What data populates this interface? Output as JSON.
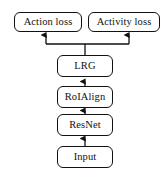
{
  "diagram": {
    "type": "flowchart",
    "direction": "bottom-to-top",
    "style": {
      "background": "#ffffff",
      "stroke": "#111111",
      "text_color": "#111111",
      "box_fill": "#ffffff"
    },
    "nodes": [
      {
        "id": "action_loss",
        "label": "Action loss",
        "row": "loss",
        "column": "left"
      },
      {
        "id": "activity_loss",
        "label": "Activity loss",
        "row": "loss",
        "column": "right"
      },
      {
        "id": "lrg",
        "label": "LRG",
        "row": "stage",
        "column": "center"
      },
      {
        "id": "roialign",
        "label": "RoIAlign",
        "row": "stage",
        "column": "center"
      },
      {
        "id": "resnet",
        "label": "ResNet",
        "row": "stage",
        "column": "center"
      },
      {
        "id": "input",
        "label": "Input",
        "row": "stage",
        "column": "center"
      }
    ],
    "edges": [
      {
        "from": "input",
        "to": "resnet",
        "arrow": "up"
      },
      {
        "from": "resnet",
        "to": "roialign",
        "arrow": "up"
      },
      {
        "from": "roialign",
        "to": "lrg",
        "arrow": "up"
      },
      {
        "from": "lrg",
        "to": "action_loss",
        "arrow": "up",
        "via": "bus"
      },
      {
        "from": "lrg",
        "to": "activity_loss",
        "arrow": "up",
        "via": "bus"
      }
    ]
  }
}
